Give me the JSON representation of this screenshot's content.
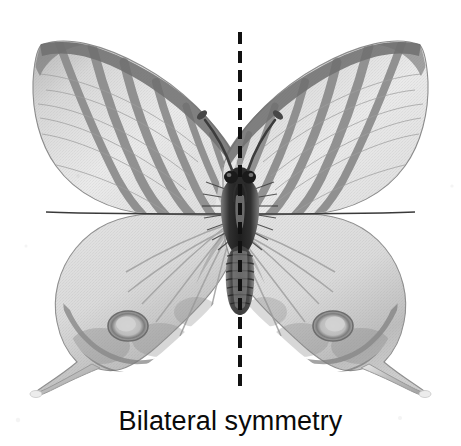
{
  "figure": {
    "caption": "Bilateral symmetry",
    "background_color": "#ffffff",
    "width": 461,
    "height": 446
  },
  "symmetry_axis": {
    "name": "vertical-dashed-mirror-line",
    "orientation": "vertical",
    "x": 240,
    "y_start": 32,
    "y_end": 392,
    "color": "#111111",
    "line_width": 4,
    "dash_length": 12,
    "gap_length": 7
  },
  "specimen": {
    "common_form": "swallowtail-butterfly",
    "view": "dorsal-spread",
    "axis_x": 240,
    "palette": {
      "wing_base": "#ededed",
      "wing_mid": "#d2d2d2",
      "wing_shadow": "#a8a8a8",
      "stripe": "#8d8d8d",
      "stripe_dark": "#6e6e6e",
      "vein": "#9a9a9a",
      "margin": "#5f5f5f",
      "body_dark": "#2a2a2a",
      "body_mid": "#5a5a5a",
      "body_light": "#b9b9b9",
      "antenna": "#3a3a3a",
      "tail_tip": "#dedede"
    },
    "parts": [
      {
        "name": "left-forewing",
        "apex_x": 40,
        "apex_y": 44,
        "stripe_count": 6
      },
      {
        "name": "right-forewing",
        "apex_x": 428,
        "apex_y": 44,
        "stripe_count": 6
      },
      {
        "name": "left-hindwing",
        "eyespot_x": 128,
        "eyespot_y": 325
      },
      {
        "name": "right-hindwing",
        "eyespot_x": 352,
        "eyespot_y": 325
      },
      {
        "name": "left-tail",
        "tip_x": 37,
        "tip_y": 394
      },
      {
        "name": "right-tail",
        "tip_x": 443,
        "tip_y": 394
      },
      {
        "name": "thorax",
        "top_y": 180,
        "bottom_y": 242
      },
      {
        "name": "abdomen",
        "top_y": 242,
        "bottom_y": 312,
        "segments": 8
      },
      {
        "name": "head",
        "y": 178
      },
      {
        "name": "left-antenna",
        "tip_x": 200,
        "tip_y": 112
      },
      {
        "name": "right-antenna",
        "tip_x": 280,
        "tip_y": 112
      }
    ]
  }
}
